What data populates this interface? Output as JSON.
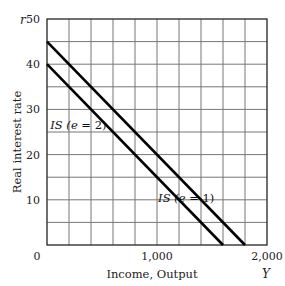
{
  "chart_data": {
    "type": "line",
    "title": "",
    "xlabel": "Income, Output",
    "xvar": "Y",
    "ylabel": "Real interest rate",
    "yvar": "r",
    "xlim": [
      0,
      2000
    ],
    "ylim": [
      0,
      50
    ],
    "x_ticks": [
      {
        "value": 0,
        "label": "0"
      },
      {
        "value": 1000,
        "label": "1,000"
      },
      {
        "value": 2000,
        "label": "2,000"
      }
    ],
    "y_ticks": [
      {
        "value": 10,
        "label": "10"
      },
      {
        "value": 20,
        "label": "20"
      },
      {
        "value": 30,
        "label": "30"
      },
      {
        "value": 40,
        "label": "40"
      },
      {
        "value": 50,
        "label": "50"
      }
    ],
    "grid": true,
    "grid_x_step": 200,
    "grid_y_step": 5,
    "series": [
      {
        "name": "IS (e = 1)",
        "x": [
          0,
          1800
        ],
        "y": [
          45,
          0
        ],
        "label_pos": [
          1010,
          10.5
        ]
      },
      {
        "name": "IS (e = 2)",
        "x": [
          0,
          1600
        ],
        "y": [
          40,
          0
        ],
        "label_pos": [
          30,
          26.5
        ]
      }
    ],
    "legend": "inline labels"
  }
}
